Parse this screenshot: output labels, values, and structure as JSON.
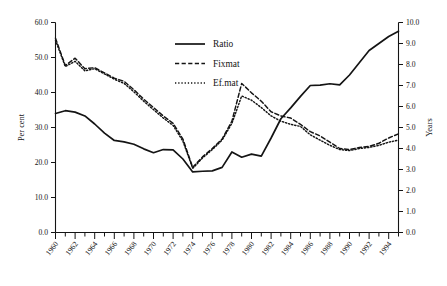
{
  "chart_data": {
    "type": "line",
    "title": "",
    "subtitle": "",
    "xlabel": "",
    "ylabel": "Per cent",
    "ylabel_right": "Years",
    "grid": false,
    "legend_position": "top-center",
    "xlim": [
      1960,
      1995
    ],
    "ylim": [
      0,
      60
    ],
    "ylim_right": [
      0,
      10
    ],
    "xtick_labels": [
      "1960",
      "1961",
      "1962",
      "1963",
      "1964",
      "1965",
      "1966",
      "1967",
      "1968",
      "1969",
      "1970",
      "1971",
      "1972",
      "1973",
      "1974",
      "1975",
      "1976",
      "1977",
      "1978",
      "1979",
      "1980",
      "1981",
      "1982",
      "1983",
      "1984",
      "1985",
      "1986",
      "1987",
      "1988",
      "1989",
      "1990",
      "1991",
      "1992",
      "1993",
      "1994",
      "1995"
    ],
    "xtick_labels_shown": [
      "1960",
      "1962",
      "1964",
      "1966",
      "1968",
      "1970",
      "1972",
      "1974",
      "1976",
      "1978",
      "1980",
      "1982",
      "1984",
      "1986",
      "1988",
      "1990",
      "1992",
      "1994"
    ],
    "ytick_labels_left": [
      "0.0",
      "10.0",
      "20.0",
      "30.0",
      "40.0",
      "50.0",
      "60.0"
    ],
    "ytick_values_left": [
      0,
      10,
      20,
      30,
      40,
      50,
      60
    ],
    "ytick_labels_right": [
      "0.0",
      "1.0",
      "2.0",
      "3.0",
      "4.0",
      "5.0",
      "6.0",
      "7.0",
      "8.0",
      "9.0",
      "10.0"
    ],
    "ytick_values_right": [
      0,
      1,
      2,
      3,
      4,
      5,
      6,
      7,
      8,
      9,
      10
    ],
    "x": [
      1960,
      1961,
      1962,
      1963,
      1964,
      1965,
      1966,
      1967,
      1968,
      1969,
      1970,
      1971,
      1972,
      1973,
      1974,
      1975,
      1976,
      1977,
      1978,
      1979,
      1980,
      1981,
      1982,
      1983,
      1984,
      1985,
      1986,
      1987,
      1988,
      1989,
      1990,
      1991,
      1992,
      1993,
      1994,
      1995
    ],
    "series": [
      {
        "name": "Ratio",
        "axis": "left",
        "units": "Per cent",
        "style": "solid",
        "color": "#141414",
        "values": [
          34.0,
          34.8,
          34.4,
          33.3,
          31.0,
          28.4,
          26.3,
          25.9,
          25.2,
          23.9,
          22.8,
          23.7,
          23.6,
          21.0,
          17.3,
          17.5,
          17.6,
          18.6,
          23.0,
          21.5,
          22.4,
          21.8,
          27.0,
          32.5,
          35.6,
          38.9,
          42.0,
          42.1,
          42.5,
          42.2,
          45.0,
          48.5,
          52.0,
          54.0,
          56.0,
          57.5
        ]
      },
      {
        "name": "Fixmat",
        "axis": "right",
        "units": "Years",
        "style": "dashed",
        "color": "#141414",
        "values": [
          9.25,
          7.95,
          8.3,
          7.8,
          7.85,
          7.6,
          7.35,
          7.2,
          6.8,
          6.35,
          5.95,
          5.55,
          5.2,
          4.45,
          3.1,
          3.6,
          4.0,
          4.45,
          5.3,
          7.1,
          6.65,
          6.25,
          5.75,
          5.55,
          5.45,
          5.15,
          4.8,
          4.6,
          4.3,
          4.0,
          3.95,
          4.05,
          4.1,
          4.25,
          4.5,
          4.7
        ]
      },
      {
        "name": "Ef.mat",
        "axis": "right",
        "units": "Years",
        "style": "dotted",
        "color": "#141414",
        "values": [
          9.15,
          7.9,
          8.15,
          7.7,
          7.8,
          7.55,
          7.3,
          7.1,
          6.7,
          6.25,
          5.85,
          5.45,
          5.1,
          4.35,
          3.05,
          3.55,
          3.95,
          4.4,
          5.2,
          6.5,
          6.3,
          5.95,
          5.55,
          5.3,
          5.15,
          5.05,
          4.65,
          4.4,
          4.15,
          3.95,
          3.9,
          4.0,
          4.05,
          4.15,
          4.3,
          4.4
        ]
      }
    ]
  },
  "legend": {
    "entries": [
      {
        "label": "Ratio",
        "style": "solid"
      },
      {
        "label": "Fixmat",
        "style": "dashed"
      },
      {
        "label": "Ef.mat",
        "style": "dotted"
      }
    ]
  },
  "axes": {
    "left_title": "Per cent",
    "right_title": "Years"
  }
}
